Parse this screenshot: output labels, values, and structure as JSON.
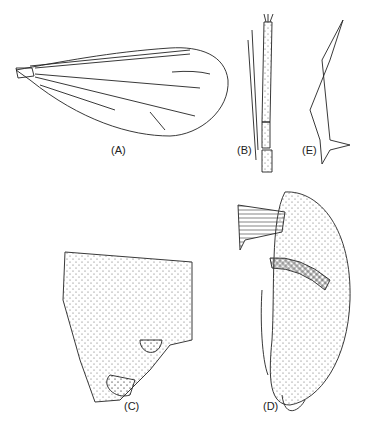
{
  "figure": {
    "type": "morphology-illustration",
    "panels": [
      {
        "id": "A",
        "label": "(A)",
        "subject": "wing"
      },
      {
        "id": "B",
        "label": "(B)",
        "subject": "palp / antennal segments"
      },
      {
        "id": "C",
        "label": "(C)",
        "subject": "genitalia, lateral view"
      },
      {
        "id": "D",
        "label": "(D)",
        "subject": "genitalia, detailed view"
      },
      {
        "id": "E",
        "label": "(E)",
        "subject": "spine / sclerite"
      }
    ]
  },
  "colors": {
    "ink": "#222222",
    "background": "#ffffff"
  }
}
